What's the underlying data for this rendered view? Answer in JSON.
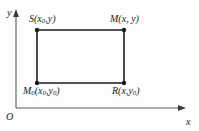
{
  "figure": {
    "kind": "coordinate-rectangle-diagram",
    "width": 199,
    "height": 131,
    "background_color": "#fdfdfc",
    "stroke_color": "#1b1b1b",
    "axis_color": "#5a5a5a"
  },
  "axes": {
    "origin_label": "O",
    "x_axis_label": "x",
    "y_axis_label": "y",
    "x_axis": {
      "x1": 16,
      "y1": 108,
      "x2": 185,
      "y2": 108,
      "arrow": "right"
    },
    "y_axis": {
      "x1": 16,
      "y1": 108,
      "x2": 16,
      "y2": 12,
      "arrow": "up"
    }
  },
  "rectangle": {
    "left": 37,
    "top": 30,
    "right": 124,
    "bottom": 83,
    "stroke_width": 1.6
  },
  "vertices": [
    {
      "id": "S",
      "name": "S",
      "label": "S(x₀,y)",
      "point_label": "S",
      "coord_x": "x",
      "coord_x_sub": "0",
      "coord_y": "y",
      "coord_y_sub": "",
      "px": 37,
      "py": 30,
      "position": "top-left"
    },
    {
      "id": "M",
      "name": "M",
      "label": "M(x, y)",
      "point_label": "M",
      "coord_x": "x",
      "coord_x_sub": "",
      "coord_y": "y",
      "coord_y_sub": "",
      "px": 124,
      "py": 30,
      "position": "top-right"
    },
    {
      "id": "M0",
      "name": "M0",
      "label": "M₀(x₀,y₀)",
      "point_label": "M",
      "point_label_sub": "0",
      "coord_x": "x",
      "coord_x_sub": "0",
      "coord_y": "y",
      "coord_y_sub": "0",
      "px": 37,
      "py": 83,
      "position": "bottom-left"
    },
    {
      "id": "R",
      "name": "R",
      "label": "R(x,y₀)",
      "point_label": "R",
      "coord_x": "x",
      "coord_x_sub": "",
      "coord_y": "y",
      "coord_y_sub": "0",
      "px": 124,
      "py": 83,
      "position": "bottom-right"
    }
  ]
}
